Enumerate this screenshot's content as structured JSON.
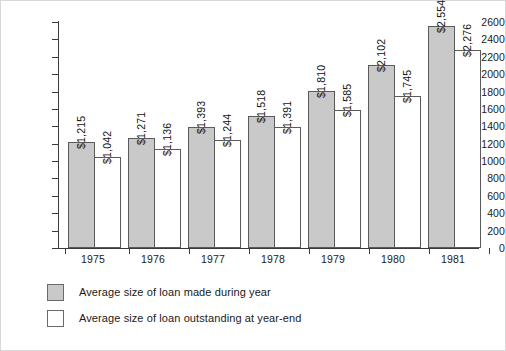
{
  "chart_data": {
    "type": "bar",
    "title": "",
    "subtitle": "",
    "xlabel": "",
    "ylabel": "",
    "categories": [
      "1975",
      "1976",
      "1977",
      "1978",
      "1979",
      "1980",
      "1981"
    ],
    "ylim": [
      0,
      2600
    ],
    "ytick_step": 200,
    "yticks": [
      "0",
      "200",
      "400",
      "600",
      "800",
      "1000",
      "1200",
      "1400",
      "1600",
      "1800",
      "2000",
      "2200",
      "2400",
      "2600"
    ],
    "grid": false,
    "legend_position": "below-left",
    "series": [
      {
        "name": "Average size of loan made during year",
        "key": "made",
        "color": "#c9c9c9",
        "values": [
          1215,
          1271,
          1393,
          1518,
          1810,
          2102,
          2554
        ],
        "labels": [
          "$1,215",
          "$1,271",
          "$1,393",
          "$1,518",
          "$1,810",
          "$2,102",
          "$2,554"
        ]
      },
      {
        "name": "Average size of loan outstanding at year-end",
        "key": "outstanding",
        "color": "#ffffff",
        "values": [
          1042,
          1136,
          1244,
          1391,
          1585,
          1745,
          2276
        ],
        "labels": [
          "$1,042",
          "$1,136",
          "$1,244",
          "$1,391",
          "$1,585",
          "$1,745",
          "$2,276"
        ]
      }
    ]
  },
  "legend": {
    "items": [
      {
        "label": "Average size of loan made during year",
        "swatch": "made"
      },
      {
        "label": "Average size of loan outstanding at year-end",
        "swatch": "outstanding"
      }
    ]
  },
  "colors": {
    "bar_made_fill": "#c9c9c9",
    "bar_outstanding_fill": "#ffffff",
    "bar_border": "#5a5a5a",
    "axis": "#3a3a3a",
    "text": "#1a1a1a",
    "frame": "#d8d8d8"
  }
}
